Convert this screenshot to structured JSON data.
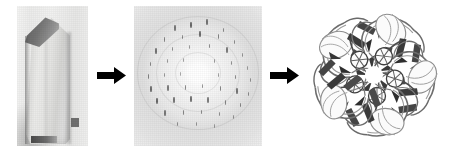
{
  "figure": {
    "background_color": "#ffffff",
    "width": 452,
    "height": 152,
    "panel_count": 3,
    "arrow_count": 2,
    "arrow_color": "#000000",
    "caption_text": ""
  },
  "panels": [
    {
      "id": "crystal",
      "label": "",
      "content": "grayscale photomicrograph of an elongated hexagonal protein crystal with a dark slanted top facet and a dark scale bar at lower left",
      "kind": "photograph",
      "tone": "grayscale",
      "x": 17,
      "y": 6,
      "width": 71,
      "height": 140
    },
    {
      "id": "diffraction",
      "label": "",
      "content": "X-ray diffraction pattern: bright central beam-stop halo surrounded by concentric rings of dark Bragg reflection spots on a light gray background",
      "kind": "detector-image",
      "tone": "grayscale",
      "x": 134,
      "y": 6,
      "width": 128,
      "height": 140
    },
    {
      "id": "structure",
      "label": "",
      "content": "ribbon diagram of a pentameric protein viewed down its five-fold axis; five identical subunits of beta-sheets and alpha-helices arranged around a central pore",
      "kind": "ribbon-diagram",
      "tone": "grayscale",
      "symmetry": "5-fold",
      "subunit_count": 5,
      "x": 303,
      "y": 4,
      "width": 142,
      "height": 144
    }
  ],
  "arrows": [
    {
      "id": "arrow-1",
      "from": "crystal",
      "to": "diffraction",
      "direction": "right",
      "x": 97,
      "y": 68,
      "width": 28,
      "height": 14
    },
    {
      "id": "arrow-2",
      "from": "diffraction",
      "to": "structure",
      "direction": "right",
      "x": 270,
      "y": 68,
      "width": 28,
      "height": 14
    }
  ],
  "chart_data": {
    "type": "scatter",
    "xlabel": "",
    "ylabel": "",
    "legend": [],
    "grid": false,
    "center": [
      64,
      67
    ],
    "note": "Bragg reflection spots plotted as panel-relative (x, y) pixel positions with relative intensity 0-1; spots render as short vertical streaks.",
    "spots": [
      [
        64,
        67,
        0.3
      ],
      [
        41,
        22,
        0.55
      ],
      [
        57,
        19,
        0.7
      ],
      [
        73,
        16,
        0.6
      ],
      [
        89,
        24,
        0.45
      ],
      [
        30,
        33,
        0.5
      ],
      [
        48,
        31,
        0.45
      ],
      [
        66,
        28,
        0.65
      ],
      [
        84,
        30,
        0.5
      ],
      [
        100,
        36,
        0.4
      ],
      [
        22,
        45,
        0.6
      ],
      [
        38,
        43,
        0.4
      ],
      [
        55,
        41,
        0.35
      ],
      [
        75,
        40,
        0.45
      ],
      [
        93,
        44,
        0.55
      ],
      [
        108,
        49,
        0.35
      ],
      [
        16,
        58,
        0.45
      ],
      [
        33,
        55,
        0.35
      ],
      [
        49,
        54,
        0.3
      ],
      [
        80,
        55,
        0.35
      ],
      [
        97,
        57,
        0.4
      ],
      [
        113,
        62,
        0.3
      ],
      [
        14,
        70,
        0.5
      ],
      [
        30,
        69,
        0.35
      ],
      [
        46,
        68,
        0.25
      ],
      [
        84,
        69,
        0.3
      ],
      [
        101,
        71,
        0.45
      ],
      [
        116,
        74,
        0.35
      ],
      [
        17,
        83,
        0.65
      ],
      [
        34,
        82,
        0.55
      ],
      [
        51,
        81,
        0.5
      ],
      [
        68,
        80,
        0.45
      ],
      [
        86,
        82,
        0.5
      ],
      [
        103,
        85,
        0.6
      ],
      [
        114,
        88,
        0.4
      ],
      [
        23,
        95,
        0.7
      ],
      [
        40,
        94,
        0.6
      ],
      [
        57,
        93,
        0.65
      ],
      [
        74,
        94,
        0.55
      ],
      [
        91,
        96,
        0.5
      ],
      [
        106,
        99,
        0.45
      ],
      [
        31,
        107,
        0.55
      ],
      [
        49,
        106,
        0.5
      ],
      [
        67,
        106,
        0.45
      ],
      [
        85,
        108,
        0.4
      ],
      [
        99,
        111,
        0.35
      ],
      [
        43,
        118,
        0.4
      ],
      [
        62,
        118,
        0.35
      ],
      [
        80,
        120,
        0.3
      ]
    ]
  }
}
